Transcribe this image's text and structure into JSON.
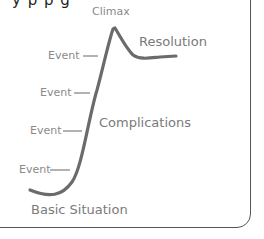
{
  "diagram": {
    "type": "plot-structure-arc",
    "top_fragment": "y p p g",
    "labels": {
      "climax": "Climax",
      "resolution": "Resolution",
      "complications": "Complications",
      "basic_situation": "Basic Situation",
      "events": [
        "Event",
        "Event",
        "Event",
        "Event"
      ]
    },
    "colors": {
      "curve": "#6b6b6b",
      "label": "#8a8a8a",
      "border": "#555555"
    }
  }
}
